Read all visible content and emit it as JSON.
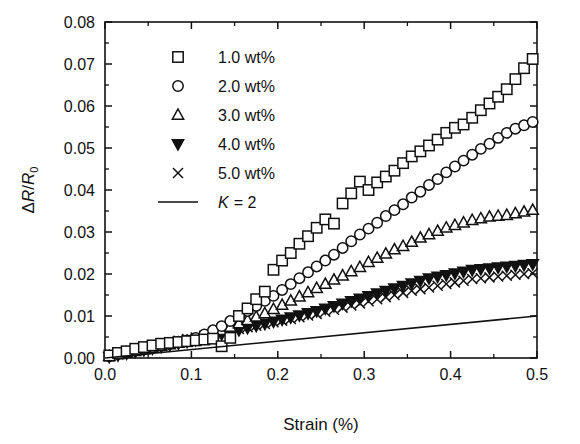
{
  "chart_data": {
    "type": "scatter",
    "title": "",
    "xlabel": "Strain (%)",
    "ylabel": "ΔR/R₀",
    "xlim": [
      0.0,
      0.5
    ],
    "ylim": [
      0.0,
      0.08
    ],
    "xticks": [
      "0.0",
      "0.1",
      "0.2",
      "0.3",
      "0.4",
      "0.5"
    ],
    "xtick_values": [
      0.0,
      0.1,
      0.2,
      0.3,
      0.4,
      0.5
    ],
    "yticks": [
      "0.00",
      "0.01",
      "0.02",
      "0.03",
      "0.04",
      "0.05",
      "0.06",
      "0.07",
      "0.08"
    ],
    "ytick_values": [
      0.0,
      0.01,
      0.02,
      0.03,
      0.04,
      0.05,
      0.06,
      0.07,
      0.08
    ],
    "minor_tick_step_x": 0.05,
    "minor_tick_step_y": 0.005,
    "grid": false,
    "legend_position": "upper-left-inside",
    "series": [
      {
        "name": "1.0 wt%",
        "marker": "open-square",
        "color": "#111111",
        "x": [
          0.005,
          0.015,
          0.025,
          0.035,
          0.045,
          0.055,
          0.065,
          0.075,
          0.085,
          0.095,
          0.105,
          0.115,
          0.125,
          0.135,
          0.145,
          0.155,
          0.165,
          0.175,
          0.185,
          0.195,
          0.205,
          0.215,
          0.225,
          0.235,
          0.245,
          0.255,
          0.265,
          0.275,
          0.285,
          0.295,
          0.305,
          0.315,
          0.325,
          0.335,
          0.345,
          0.355,
          0.365,
          0.375,
          0.385,
          0.395,
          0.405,
          0.415,
          0.425,
          0.435,
          0.445,
          0.455,
          0.465,
          0.475,
          0.485,
          0.495
        ],
        "y": [
          0.0006,
          0.0012,
          0.0016,
          0.0022,
          0.0026,
          0.003,
          0.0034,
          0.0036,
          0.0038,
          0.004,
          0.0042,
          0.0044,
          0.0046,
          0.0028,
          0.0048,
          0.01,
          0.0118,
          0.014,
          0.0158,
          0.021,
          0.0232,
          0.025,
          0.0272,
          0.029,
          0.031,
          0.033,
          0.032,
          0.0368,
          0.0392,
          0.042,
          0.04,
          0.0418,
          0.0432,
          0.0446,
          0.0464,
          0.048,
          0.0492,
          0.0506,
          0.052,
          0.0536,
          0.0548,
          0.0556,
          0.0572,
          0.059,
          0.0606,
          0.0622,
          0.064,
          0.0664,
          0.069,
          0.0712
        ]
      },
      {
        "name": "2.0 wt%",
        "marker": "open-circle",
        "color": "#111111",
        "x": [
          0.005,
          0.015,
          0.025,
          0.035,
          0.045,
          0.055,
          0.065,
          0.075,
          0.085,
          0.095,
          0.105,
          0.115,
          0.125,
          0.135,
          0.145,
          0.155,
          0.165,
          0.175,
          0.185,
          0.195,
          0.205,
          0.215,
          0.225,
          0.235,
          0.245,
          0.255,
          0.265,
          0.275,
          0.285,
          0.295,
          0.305,
          0.315,
          0.325,
          0.335,
          0.345,
          0.355,
          0.365,
          0.375,
          0.385,
          0.395,
          0.405,
          0.415,
          0.425,
          0.435,
          0.445,
          0.455,
          0.465,
          0.475,
          0.485,
          0.495
        ],
        "y": [
          0.0004,
          0.001,
          0.0014,
          0.0018,
          0.0022,
          0.0026,
          0.003,
          0.0034,
          0.0038,
          0.0042,
          0.0048,
          0.0056,
          0.0066,
          0.0076,
          0.0088,
          0.01,
          0.0112,
          0.0124,
          0.0136,
          0.0148,
          0.0162,
          0.0176,
          0.019,
          0.0204,
          0.0218,
          0.0232,
          0.0246,
          0.0262,
          0.0278,
          0.0294,
          0.0308,
          0.0322,
          0.0338,
          0.0352,
          0.0366,
          0.0382,
          0.0396,
          0.0412,
          0.0426,
          0.0442,
          0.0456,
          0.047,
          0.0484,
          0.0498,
          0.051,
          0.0524,
          0.0536,
          0.0546,
          0.0554,
          0.0562
        ]
      },
      {
        "name": "3.0 wt%",
        "marker": "open-triangle-up",
        "color": "#111111",
        "x": [
          0.005,
          0.015,
          0.025,
          0.035,
          0.045,
          0.055,
          0.065,
          0.075,
          0.085,
          0.095,
          0.105,
          0.115,
          0.125,
          0.135,
          0.145,
          0.155,
          0.165,
          0.175,
          0.185,
          0.195,
          0.205,
          0.215,
          0.225,
          0.235,
          0.245,
          0.255,
          0.265,
          0.275,
          0.285,
          0.295,
          0.305,
          0.315,
          0.325,
          0.335,
          0.345,
          0.355,
          0.365,
          0.375,
          0.385,
          0.395,
          0.405,
          0.415,
          0.425,
          0.435,
          0.445,
          0.455,
          0.465,
          0.475,
          0.485,
          0.495
        ],
        "y": [
          0.0004,
          0.0008,
          0.0012,
          0.0016,
          0.002,
          0.0024,
          0.0028,
          0.0032,
          0.0036,
          0.004,
          0.0044,
          0.005,
          0.0058,
          0.0066,
          0.0074,
          0.0082,
          0.009,
          0.0098,
          0.0106,
          0.0116,
          0.0126,
          0.0136,
          0.0146,
          0.0156,
          0.0166,
          0.0176,
          0.0186,
          0.0196,
          0.0206,
          0.0216,
          0.0228,
          0.0238,
          0.0248,
          0.0258,
          0.0266,
          0.0276,
          0.0286,
          0.0294,
          0.0302,
          0.031,
          0.0316,
          0.0322,
          0.0328,
          0.0332,
          0.0336,
          0.0338,
          0.034,
          0.0344,
          0.0348,
          0.0352
        ]
      },
      {
        "name": "4.0 wt%",
        "marker": "filled-triangle-down",
        "color": "#111111",
        "x": [
          0.005,
          0.015,
          0.025,
          0.035,
          0.045,
          0.055,
          0.065,
          0.075,
          0.085,
          0.095,
          0.105,
          0.115,
          0.125,
          0.135,
          0.145,
          0.155,
          0.165,
          0.175,
          0.185,
          0.195,
          0.205,
          0.215,
          0.225,
          0.235,
          0.245,
          0.255,
          0.265,
          0.275,
          0.285,
          0.295,
          0.305,
          0.315,
          0.325,
          0.335,
          0.345,
          0.355,
          0.365,
          0.375,
          0.385,
          0.395,
          0.405,
          0.415,
          0.425,
          0.435,
          0.445,
          0.455,
          0.465,
          0.475,
          0.485,
          0.495
        ],
        "y": [
          0.0003,
          0.0007,
          0.0011,
          0.0015,
          0.0019,
          0.0023,
          0.0027,
          0.0031,
          0.0035,
          0.0039,
          0.0043,
          0.0047,
          0.0052,
          0.0057,
          0.0062,
          0.0067,
          0.0072,
          0.0077,
          0.0082,
          0.0087,
          0.0092,
          0.0097,
          0.0102,
          0.0107,
          0.0112,
          0.0118,
          0.0124,
          0.013,
          0.0136,
          0.0142,
          0.0148,
          0.0154,
          0.016,
          0.0166,
          0.0172,
          0.0178,
          0.0184,
          0.019,
          0.0194,
          0.0198,
          0.0202,
          0.0206,
          0.021,
          0.0212,
          0.0214,
          0.0216,
          0.0218,
          0.022,
          0.0222,
          0.0224
        ]
      },
      {
        "name": "5.0 wt%",
        "marker": "cross-x",
        "color": "#111111",
        "x": [
          0.005,
          0.015,
          0.025,
          0.035,
          0.045,
          0.055,
          0.065,
          0.075,
          0.085,
          0.095,
          0.105,
          0.115,
          0.125,
          0.135,
          0.145,
          0.155,
          0.165,
          0.175,
          0.185,
          0.195,
          0.205,
          0.215,
          0.225,
          0.235,
          0.245,
          0.255,
          0.265,
          0.275,
          0.285,
          0.295,
          0.305,
          0.315,
          0.325,
          0.335,
          0.345,
          0.355,
          0.365,
          0.375,
          0.385,
          0.395,
          0.405,
          0.415,
          0.425,
          0.435,
          0.445,
          0.455,
          0.465,
          0.475,
          0.485,
          0.495
        ],
        "y": [
          0.0004,
          0.0009,
          0.0014,
          0.0019,
          0.0024,
          0.0029,
          0.0033,
          0.0037,
          0.0041,
          0.0045,
          0.0049,
          0.0053,
          0.0057,
          0.0061,
          0.0065,
          0.0069,
          0.0073,
          0.0077,
          0.0081,
          0.0085,
          0.0089,
          0.0093,
          0.0097,
          0.0101,
          0.0105,
          0.011,
          0.0115,
          0.012,
          0.0125,
          0.013,
          0.0135,
          0.014,
          0.0145,
          0.015,
          0.0155,
          0.016,
          0.0164,
          0.0168,
          0.0172,
          0.0176,
          0.018,
          0.0184,
          0.0188,
          0.019,
          0.0192,
          0.0194,
          0.0196,
          0.0198,
          0.02,
          0.0202
        ]
      }
    ],
    "reference_line": {
      "name": "K = 2",
      "label_prefix": "K",
      "label_suffix": "= 2",
      "slope": 2.0,
      "x": [
        0.0,
        0.5
      ],
      "y": [
        0.0,
        0.01
      ]
    }
  },
  "legend": {
    "items": [
      {
        "label": "1.0 wt%",
        "marker": "open-square"
      },
      {
        "label": "2.0 wt%",
        "marker": "open-circle"
      },
      {
        "label": "3.0 wt%",
        "marker": "open-triangle-up"
      },
      {
        "label": "4.0 wt%",
        "marker": "filled-triangle-down"
      },
      {
        "label": "5.0 wt%",
        "marker": "cross-x"
      },
      {
        "label": "K = 2",
        "marker": "line"
      }
    ]
  }
}
